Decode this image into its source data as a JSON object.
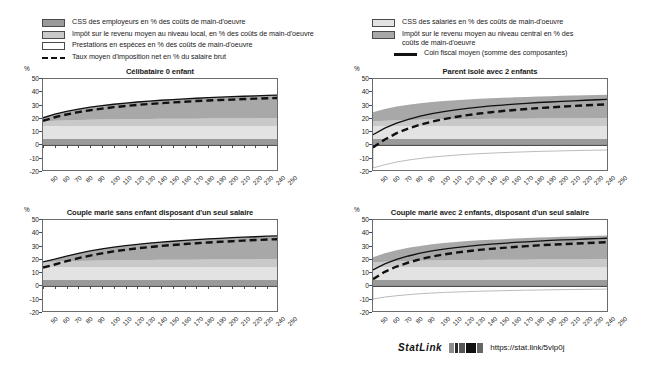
{
  "legends": {
    "left": [
      {
        "type": "swatch",
        "fill": "#9a9a9a",
        "label": "CSS des employeurs en % des coûts de main-d'oeuvre"
      },
      {
        "type": "swatch",
        "fill": "#c9c9c9",
        "label": "Impôt sur le revenu moyen au niveau local, en % des coûts de main-d'oeuvre"
      },
      {
        "type": "swatch",
        "fill": "#ffffff",
        "label": "Prestations en espèces en % des coûts de main-d'oeuvre"
      },
      {
        "type": "dashed",
        "fill": "#111111",
        "label": "Taux moyen d'imposition net en % du salaire brut"
      }
    ],
    "right": [
      {
        "type": "swatch",
        "fill": "#e3e3e3",
        "label": "CSS des salariés en % des coûts de main-d'oeuvre"
      },
      {
        "type": "swatch",
        "fill": "#a8a8a8",
        "label": "Impôt sur le revenu moyen au niveau central en %  des coûts de main-d'oeuvre"
      },
      {
        "type": "solid",
        "fill": "#111111",
        "label": "Coin fiscal moyen (somme des composantes)"
      }
    ]
  },
  "axis": {
    "unit": "%",
    "y_ticks": [
      "50",
      "40",
      "30",
      "20",
      "10",
      "0",
      "-10",
      "-20"
    ],
    "y_min": -20,
    "y_max": 50,
    "x_ticks": [
      "50",
      "60",
      "70",
      "80",
      "90",
      "100",
      "110",
      "120",
      "130",
      "140",
      "150",
      "160",
      "170",
      "180",
      "190",
      "200",
      "210",
      "220",
      "230",
      "240",
      "250"
    ],
    "x_min": 50,
    "x_max": 250
  },
  "footer": {
    "statlink_label": "StatLink",
    "glyph": "barcode-icon",
    "url": "https://stat.link/5vlp0j"
  },
  "chart_data": {
    "type": "area",
    "title": "",
    "xlabel": "",
    "ylabel": "%",
    "ylim": [
      -20,
      50
    ],
    "xlim": [
      50,
      250
    ],
    "grid": false,
    "legend_position": "top",
    "x": [
      50,
      60,
      70,
      80,
      90,
      100,
      110,
      120,
      130,
      140,
      150,
      160,
      170,
      180,
      190,
      200,
      210,
      220,
      230,
      240,
      250
    ],
    "panels": [
      {
        "title": "Célibataire 0 enfant",
        "series": [
          {
            "name": "CSS des employeurs en % des coûts de main-d'oeuvre",
            "color": "#9a9a9a",
            "stack": true,
            "values": [
              5.0,
              5.0,
              5.0,
              5.0,
              5.0,
              5.0,
              5.0,
              5.0,
              5.0,
              5.0,
              5.0,
              5.0,
              5.0,
              5.0,
              5.0,
              5.0,
              5.0,
              5.0,
              5.0,
              5.0,
              5.0
            ]
          },
          {
            "name": "CSS des salariés en % des coûts de main-d'oeuvre",
            "color": "#e3e3e3",
            "stack": true,
            "values": [
              9.5,
              9.5,
              9.5,
              9.5,
              9.5,
              9.5,
              9.5,
              9.5,
              9.5,
              9.5,
              9.5,
              9.5,
              9.5,
              9.5,
              9.5,
              9.5,
              9.5,
              9.5,
              9.5,
              9.5,
              9.5
            ]
          },
          {
            "name": "Impôt sur le revenu moyen au niveau local, en % des coûts de main-d'oeuvre",
            "color": "#c9c9c9",
            "stack": true,
            "values": [
              3.5,
              4.0,
              4.3,
              4.6,
              4.8,
              5.0,
              5.1,
              5.2,
              5.3,
              5.4,
              5.5,
              5.5,
              5.6,
              5.6,
              5.7,
              5.7,
              5.8,
              5.8,
              5.8,
              5.9,
              5.9
            ]
          },
          {
            "name": "Impôt sur le revenu moyen au niveau central en %  des coûts de main-d'oeuvre",
            "color": "#a8a8a8",
            "stack": true,
            "values": [
              2.8,
              5.0,
              6.8,
              8.3,
              9.5,
              10.5,
              11.4,
              12.2,
              12.9,
              13.5,
              14.0,
              14.5,
              15.0,
              15.4,
              15.8,
              16.1,
              16.4,
              16.7,
              17.0,
              17.3,
              17.5
            ]
          },
          {
            "name": "Prestations en espèces en % des coûts de main-d'oeuvre",
            "color": "#ffffff",
            "stack": true,
            "values": [
              0,
              0,
              0,
              0,
              0,
              0,
              0,
              0,
              0,
              0,
              0,
              0,
              0,
              0,
              0,
              0,
              0,
              0,
              0,
              0,
              0
            ]
          }
        ],
        "lines": [
          {
            "name": "Coin fiscal moyen (somme des composantes)",
            "style": "solid",
            "color": "#111111",
            "values": [
              20.8,
              23.5,
              25.6,
              27.4,
              28.8,
              30.0,
              31.0,
              31.9,
              32.7,
              33.4,
              34.0,
              34.5,
              35.1,
              35.5,
              36.0,
              36.3,
              36.7,
              37.0,
              37.3,
              37.7,
              37.9
            ]
          },
          {
            "name": "Taux moyen d'imposition net en % du salaire brut",
            "style": "dashed",
            "color": "#111111",
            "values": [
              18.5,
              21.2,
              23.3,
              25.1,
              26.5,
              27.7,
              28.8,
              29.7,
              30.5,
              31.2,
              31.8,
              32.4,
              32.9,
              33.4,
              33.8,
              34.2,
              34.5,
              34.9,
              35.2,
              35.5,
              35.8
            ]
          }
        ]
      },
      {
        "title": "Parent isolé avec 2 enfants",
        "series": [
          {
            "name": "CSS des employeurs en % des coûts de main-d'oeuvre",
            "color": "#9a9a9a",
            "stack": true,
            "values": [
              5.0,
              5.0,
              5.0,
              5.0,
              5.0,
              5.0,
              5.0,
              5.0,
              5.0,
              5.0,
              5.0,
              5.0,
              5.0,
              5.0,
              5.0,
              5.0,
              5.0,
              5.0,
              5.0,
              5.0,
              5.0
            ]
          },
          {
            "name": "CSS des salariés en % des coûts de main-d'oeuvre",
            "color": "#e3e3e3",
            "stack": true,
            "values": [
              9.5,
              9.5,
              9.5,
              9.5,
              9.5,
              9.5,
              9.5,
              9.5,
              9.5,
              9.5,
              9.5,
              9.5,
              9.5,
              9.5,
              9.5,
              9.5,
              9.5,
              9.5,
              9.5,
              9.5,
              9.5
            ]
          },
          {
            "name": "Impôt sur le revenu moyen au niveau local, en % des coûts de main-d'oeuvre",
            "color": "#c9c9c9",
            "stack": true,
            "values": [
              3.5,
              4.0,
              4.3,
              4.6,
              4.8,
              5.0,
              5.1,
              5.2,
              5.3,
              5.4,
              5.5,
              5.5,
              5.6,
              5.6,
              5.7,
              5.7,
              5.8,
              5.8,
              5.8,
              5.9,
              5.9
            ]
          },
          {
            "name": "Impôt sur le revenu moyen au niveau central en %  des coûts de main-d'oeuvre",
            "color": "#a8a8a8",
            "stack": true,
            "values": [
              7.0,
              9.0,
              10.5,
              11.6,
              12.5,
              13.2,
              13.8,
              14.3,
              14.8,
              15.2,
              15.5,
              15.8,
              16.1,
              16.4,
              16.6,
              16.8,
              17.0,
              17.2,
              17.4,
              17.6,
              17.8
            ]
          },
          {
            "name": "Prestations en espèces en % des coûts de main-d'oeuvre",
            "color": "#ffffff",
            "stack": true,
            "values": [
              -17.0,
              -14.5,
              -12.5,
              -11.0,
              -9.8,
              -8.8,
              -8.0,
              -7.3,
              -6.7,
              -6.2,
              -5.8,
              -5.4,
              -5.1,
              -4.8,
              -4.5,
              -4.3,
              -4.1,
              -3.9,
              -3.7,
              -3.6,
              -3.4
            ]
          }
        ],
        "lines": [
          {
            "name": "Coin fiscal moyen (somme des composantes)",
            "style": "solid",
            "color": "#111111",
            "values": [
              8.0,
              13.0,
              16.8,
              19.7,
              22.0,
              23.9,
              25.4,
              26.7,
              27.9,
              28.9,
              29.7,
              30.4,
              31.1,
              31.7,
              32.3,
              32.7,
              33.2,
              33.6,
              34.0,
              34.4,
              34.8
            ]
          },
          {
            "name": "Taux moyen d'imposition net en % du salaire brut",
            "style": "dashed",
            "color": "#111111",
            "values": [
              -1.5,
              4.5,
              9.2,
              12.8,
              15.6,
              17.9,
              19.8,
              21.4,
              22.8,
              24.0,
              25.0,
              25.9,
              26.7,
              27.4,
              28.1,
              28.6,
              29.2,
              29.7,
              30.2,
              30.6,
              31.0
            ]
          }
        ]
      },
      {
        "title": "Couple marié sans enfant disposant d'un seul salaire",
        "series": [
          {
            "name": "CSS des employeurs en % des coûts de main-d'oeuvre",
            "color": "#9a9a9a",
            "stack": true,
            "values": [
              5.0,
              5.0,
              5.0,
              5.0,
              5.0,
              5.0,
              5.0,
              5.0,
              5.0,
              5.0,
              5.0,
              5.0,
              5.0,
              5.0,
              5.0,
              5.0,
              5.0,
              5.0,
              5.0,
              5.0,
              5.0
            ]
          },
          {
            "name": "CSS des salariés en % des coûts de main-d'oeuvre",
            "color": "#e3e3e3",
            "stack": true,
            "values": [
              9.5,
              9.5,
              9.5,
              9.5,
              9.5,
              9.5,
              9.5,
              9.5,
              9.5,
              9.5,
              9.5,
              9.5,
              9.5,
              9.5,
              9.5,
              9.5,
              9.5,
              9.5,
              9.5,
              9.5,
              9.5
            ]
          },
          {
            "name": "Impôt sur le revenu moyen au niveau local, en % des coûts de main-d'oeuvre",
            "color": "#c9c9c9",
            "stack": true,
            "values": [
              3.5,
              4.0,
              4.3,
              4.6,
              4.8,
              5.0,
              5.1,
              5.2,
              5.3,
              5.4,
              5.5,
              5.5,
              5.6,
              5.6,
              5.7,
              5.7,
              5.8,
              5.8,
              5.8,
              5.9,
              5.9
            ]
          },
          {
            "name": "Impôt sur le revenu moyen au niveau central en %  des coûts de main-d'oeuvre",
            "color": "#a8a8a8",
            "stack": true,
            "values": [
              0.5,
              2.0,
              4.0,
              5.8,
              7.4,
              8.8,
              10.0,
              11.0,
              11.9,
              12.7,
              13.4,
              14.0,
              14.6,
              15.1,
              15.6,
              16.0,
              16.4,
              16.8,
              17.1,
              17.4,
              17.7
            ]
          },
          {
            "name": "Prestations en espèces en % des coûts de main-d'oeuvre",
            "color": "#ffffff",
            "stack": true,
            "values": [
              0,
              0,
              0,
              0,
              0,
              0,
              0,
              0,
              0,
              0,
              0,
              0,
              0,
              0,
              0,
              0,
              0,
              0,
              0,
              0,
              0
            ]
          }
        ],
        "lines": [
          {
            "name": "Coin fiscal moyen (somme des composantes)",
            "style": "solid",
            "color": "#111111",
            "values": [
              18.5,
              20.5,
              22.8,
              24.9,
              26.7,
              28.3,
              29.6,
              30.7,
              31.7,
              32.6,
              33.4,
              34.0,
              34.7,
              35.2,
              35.8,
              36.2,
              36.7,
              37.1,
              37.4,
              37.8,
              38.1
            ]
          },
          {
            "name": "Taux moyen d'imposition net en % du salaire brut",
            "style": "dashed",
            "color": "#111111",
            "values": [
              14.2,
              16.5,
              19.0,
              21.3,
              23.2,
              24.9,
              26.4,
              27.6,
              28.7,
              29.6,
              30.5,
              31.2,
              31.9,
              32.5,
              33.1,
              33.6,
              34.0,
              34.5,
              34.9,
              35.3,
              35.6
            ]
          }
        ]
      },
      {
        "title": "Couple marié avec 2 enfants, disposant d'un seul salaire",
        "series": [
          {
            "name": "CSS des employeurs en % des coûts de main-d'oeuvre",
            "color": "#9a9a9a",
            "stack": true,
            "values": [
              5.0,
              5.0,
              5.0,
              5.0,
              5.0,
              5.0,
              5.0,
              5.0,
              5.0,
              5.0,
              5.0,
              5.0,
              5.0,
              5.0,
              5.0,
              5.0,
              5.0,
              5.0,
              5.0,
              5.0,
              5.0
            ]
          },
          {
            "name": "CSS des salariés en % des coûts de main-d'oeuvre",
            "color": "#e3e3e3",
            "stack": true,
            "values": [
              9.5,
              9.5,
              9.5,
              9.5,
              9.5,
              9.5,
              9.5,
              9.5,
              9.5,
              9.5,
              9.5,
              9.5,
              9.5,
              9.5,
              9.5,
              9.5,
              9.5,
              9.5,
              9.5,
              9.5,
              9.5
            ]
          },
          {
            "name": "Impôt sur le revenu moyen au niveau local, en % des coûts de main-d'oeuvre",
            "color": "#c9c9c9",
            "stack": true,
            "values": [
              3.5,
              4.0,
              4.3,
              4.6,
              4.8,
              5.0,
              5.1,
              5.2,
              5.3,
              5.4,
              5.5,
              5.5,
              5.6,
              5.6,
              5.7,
              5.7,
              5.8,
              5.8,
              5.8,
              5.9,
              5.9
            ]
          },
          {
            "name": "Impôt sur le revenu moyen au niveau central en %  des coûts de main-d'oeuvre",
            "color": "#a8a8a8",
            "stack": true,
            "values": [
              4.0,
              6.5,
              8.5,
              10.0,
              11.2,
              12.2,
              13.0,
              13.7,
              14.3,
              14.8,
              15.2,
              15.6,
              16.0,
              16.3,
              16.6,
              16.9,
              17.1,
              17.3,
              17.5,
              17.7,
              17.9
            ]
          },
          {
            "name": "Prestations en espèces en % des coûts de main-d'oeuvre",
            "color": "#ffffff",
            "stack": true,
            "values": [
              -9.5,
              -8.0,
              -7.0,
              -6.2,
              -5.5,
              -5.0,
              -4.5,
              -4.2,
              -3.9,
              -3.6,
              -3.4,
              -3.2,
              -3.0,
              -2.8,
              -2.7,
              -2.5,
              -2.4,
              -2.3,
              -2.2,
              -2.1,
              -2.0
            ]
          }
        ],
        "lines": [
          {
            "name": "Coin fiscal moyen (somme des composantes)",
            "style": "solid",
            "color": "#111111",
            "values": [
              12.5,
              17.0,
              20.3,
              22.9,
              25.0,
              26.7,
              28.1,
              29.2,
              30.2,
              31.1,
              31.8,
              32.4,
              33.1,
              33.6,
              34.1,
              34.6,
              35.0,
              35.3,
              35.7,
              36.0,
              36.3
            ]
          },
          {
            "name": "Taux moyen d'imposition net en % du salaire brut",
            "style": "dashed",
            "color": "#111111",
            "values": [
              5.5,
              11.0,
              15.0,
              18.0,
              20.5,
              22.5,
              24.1,
              25.4,
              26.5,
              27.5,
              28.3,
              29.0,
              29.7,
              30.3,
              30.9,
              31.4,
              31.8,
              32.2,
              32.6,
              33.0,
              33.3
            ]
          }
        ]
      }
    ]
  }
}
